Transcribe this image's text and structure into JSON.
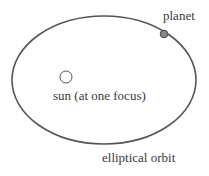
{
  "diagram": {
    "type": "elliptical-orbit",
    "labels": {
      "planet": "planet",
      "sun": "sun (at one focus)",
      "orbit": "elliptical orbit"
    },
    "colors": {
      "orbit_stroke": "#555555",
      "planet_fill": "#888888",
      "sun_stroke": "#555555",
      "text": "#3a3a3a"
    }
  }
}
